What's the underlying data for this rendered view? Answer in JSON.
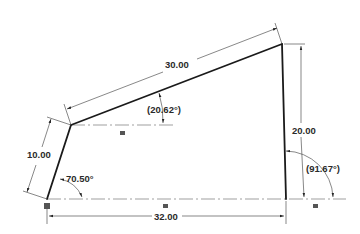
{
  "drawing": {
    "type": "2D sketch with dimensions",
    "dimensions": {
      "bottom_length": "32.00",
      "top_slanted_length": "30.00",
      "left_edge_length": "10.00",
      "right_edge_height": "20.00"
    },
    "angles": {
      "left_bottom": "70.50°",
      "top_slant": "(20.62°)",
      "right_bottom": "(91.67°)"
    },
    "constraint_symbols": {
      "horizontal_upper": "=",
      "horizontal_bottom_mid": "=",
      "horizontal_bottom_right": "=",
      "fixed_point": "■"
    },
    "colors": {
      "geometry": "#1a1a1a",
      "dimension": "#555555",
      "centerline": "#777777",
      "background": "#ffffff"
    }
  }
}
